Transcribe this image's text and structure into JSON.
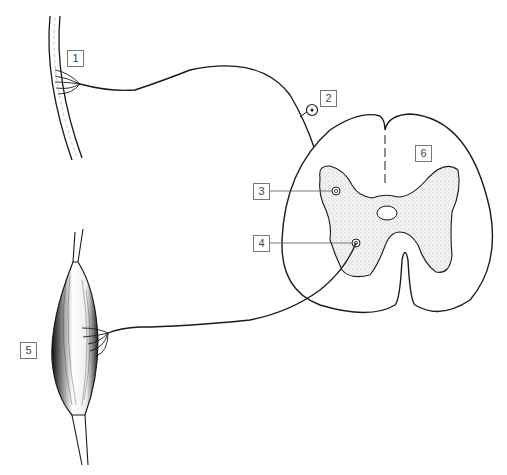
{
  "diagram": {
    "type": "reflex arc (spinal cord cross-section with sensory and motor neurons)",
    "labels": [
      {
        "id": "1",
        "text": "1",
        "target": "skin / sensory receptor endings"
      },
      {
        "id": "2",
        "text": "2",
        "target": "sensory neuron cell body (dorsal root ganglion)"
      },
      {
        "id": "3",
        "text": "3",
        "target": "interneuron synapse in dorsal horn"
      },
      {
        "id": "4",
        "text": "4",
        "target": "motor neuron in ventral horn"
      },
      {
        "id": "5",
        "text": "5",
        "target": "skeletal muscle (effector)"
      },
      {
        "id": "6",
        "text": "6",
        "target": "white matter of spinal cord"
      }
    ],
    "colors": {
      "line": "#1a1a1a",
      "grey_matter_fill": "#ebebeb",
      "label_border": "#777777",
      "background": "#ffffff"
    }
  }
}
